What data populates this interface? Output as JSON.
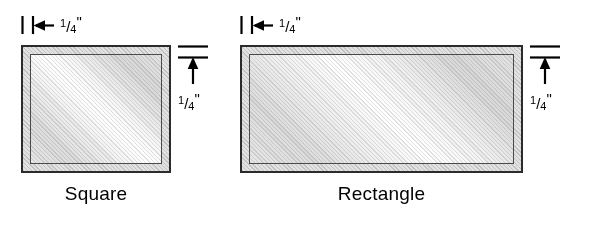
{
  "diagram": {
    "background_color": "#ffffff",
    "line_color": "#2b2b2b",
    "band_color": "#e2e2e2",
    "glass_color": "#ededed"
  },
  "dimension_labels": {
    "numerator": "1",
    "solidus": "/",
    "denominator": "4",
    "inch_mark": "\"",
    "full_text": "1/4\""
  },
  "figures": [
    {
      "id": "square",
      "caption": "Square",
      "width_callout": "1/4\"",
      "height_callout": "1/4\""
    },
    {
      "id": "rectangle",
      "caption": "Rectangle",
      "width_callout": "1/4\"",
      "height_callout": "1/4\""
    }
  ]
}
